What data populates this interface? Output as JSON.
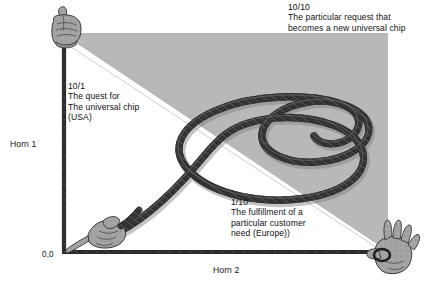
{
  "diagram": {
    "title_hidden": "",
    "axes": {
      "vertical_label": "Horn 1",
      "horizontal_label": "Horn 2",
      "origin_label": "0,0"
    },
    "labels": {
      "top_right": "10/10\nThe particular request that\nbecomes a new universal chip",
      "left": "10/1\nThe quest for\nThe universal chip\n(USA)",
      "bottom_right_inner": "1/10\nThe fulfillment of a\nparticular customer\nneed (Europe))"
    },
    "elements": {
      "shaded_region": "upper-right-triangle",
      "diagonal_band": "white-diagonal-stripe",
      "rope": "braided-spiral-rope",
      "hand_top_left": "fist-gripping-vertical-axis",
      "hand_origin": "hand-gripping-rope-start",
      "hand_bottom_right": "open-hand-gripping-horizontal-axis"
    },
    "colors": {
      "shade_gray": "#b8b8b8",
      "rope_dark": "#2a2a2a",
      "axis_dark": "#1f1f1f",
      "hand_gray": "#9a9a9a",
      "background": "#ffffff",
      "text": "#111111"
    }
  }
}
